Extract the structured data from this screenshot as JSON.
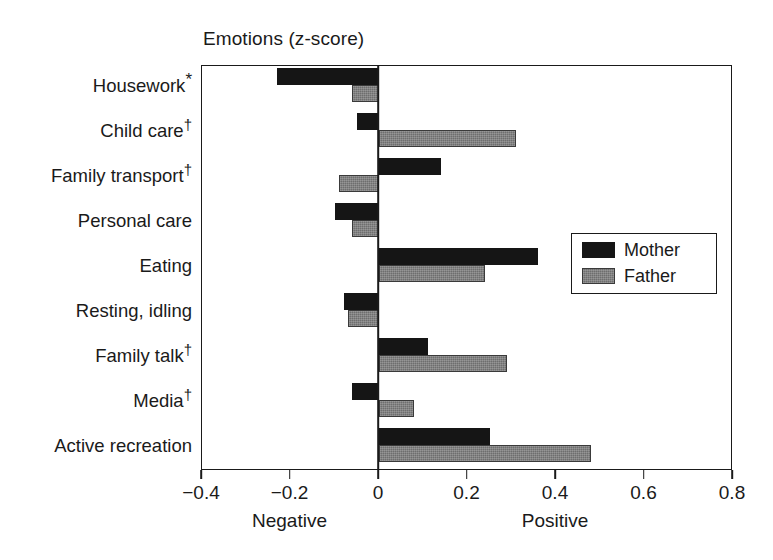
{
  "chart_data": {
    "type": "bar",
    "orientation": "horizontal",
    "title": "Emotions (z-score)",
    "xlabel": "",
    "ylabel": "",
    "xlim": [
      -0.4,
      0.8
    ],
    "xticks": [
      "-0.4",
      "-0.2",
      "0",
      "0.2",
      "0.4",
      "0.6",
      "0.8"
    ],
    "xtick_values": [
      -0.4,
      -0.2,
      0,
      0.2,
      0.4,
      0.6,
      0.8
    ],
    "axis_captions": {
      "negative": "Negative",
      "positive": "Positive"
    },
    "grid": false,
    "legend_position": "right-middle",
    "categories": [
      "Housework*",
      "Child care†",
      "Family transport†",
      "Personal care",
      "Eating",
      "Resting, idling",
      "Family talk†",
      "Media†",
      "Active recreation"
    ],
    "category_parts": [
      {
        "text": "Housework",
        "mark": "*"
      },
      {
        "text": "Child care",
        "mark": "†"
      },
      {
        "text": "Family transport",
        "mark": "†"
      },
      {
        "text": "Personal care",
        "mark": ""
      },
      {
        "text": "Eating",
        "mark": ""
      },
      {
        "text": "Resting, idling",
        "mark": ""
      },
      {
        "text": "Family talk",
        "mark": "†"
      },
      {
        "text": "Media",
        "mark": "†"
      },
      {
        "text": "Active recreation",
        "mark": ""
      }
    ],
    "series": [
      {
        "name": "Mother",
        "color": "#151515",
        "values": [
          -0.23,
          -0.05,
          0.14,
          -0.1,
          0.36,
          -0.08,
          0.11,
          -0.06,
          0.25
        ]
      },
      {
        "name": "Father",
        "color": "#6e6e6e",
        "values": [
          -0.06,
          0.31,
          -0.09,
          -0.06,
          0.24,
          -0.07,
          0.29,
          0.08,
          0.48
        ]
      }
    ]
  },
  "legend": {
    "entries": [
      {
        "label": "Mother",
        "swatch": "mother"
      },
      {
        "label": "Father",
        "swatch": "father"
      }
    ]
  }
}
